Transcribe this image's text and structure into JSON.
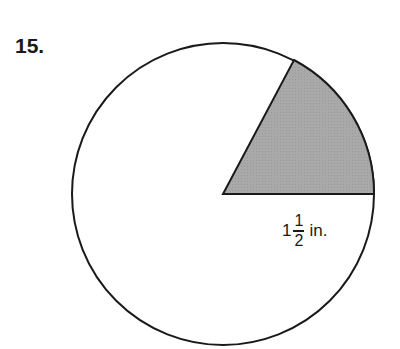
{
  "problem": {
    "number": "15."
  },
  "figure": {
    "shape": "circle",
    "center": {
      "x": 223,
      "y": 194
    },
    "radius_px": 151,
    "sector": {
      "start_angle_deg": 0,
      "end_angle_deg": 62,
      "fill": "#a8a8a8",
      "shaded": true
    },
    "stroke_color": "#1a1a1a"
  },
  "radius_label": {
    "whole": "1",
    "numerator": "1",
    "denominator": "2",
    "unit": "in."
  }
}
